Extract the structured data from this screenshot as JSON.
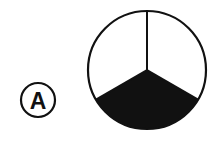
{
  "label": {
    "text": "A",
    "cx": 38,
    "cy": 100,
    "r": 17
  },
  "pie": {
    "cx": 147,
    "cy": 70,
    "r": 59,
    "sectors": 3,
    "shaded_sector": "bottom",
    "shaded_fraction": "1/3",
    "stroke": "#111111",
    "fill": "#111111",
    "background": "#ffffff"
  }
}
